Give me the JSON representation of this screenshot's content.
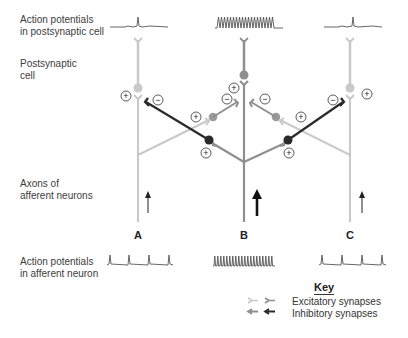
{
  "labels": {
    "ap_post_line1": "Action potentials",
    "ap_post_line2": "in postsynaptic cell",
    "postsyn_line1": "Postsynaptic",
    "postsyn_line2": "cell",
    "axons_line1": "Axons of",
    "axons_line2": "afferent neurons",
    "ap_aff_line1": "Action potentials",
    "ap_aff_line2": "in afferent neuron"
  },
  "neurons": [
    {
      "id": "A",
      "label": "A",
      "afferent_activity": "low",
      "postsynaptic_activity": "single spike"
    },
    {
      "id": "B",
      "label": "B",
      "afferent_activity": "high",
      "postsynaptic_activity": "high-frequency firing"
    },
    {
      "id": "C",
      "label": "C",
      "afferent_activity": "low",
      "postsynaptic_activity": "single spike"
    }
  ],
  "synapse_signs": {
    "excitatory": "+",
    "inhibitory": "−"
  },
  "key": {
    "title": "Key",
    "excitatory": "Excitatory synapses",
    "inhibitory": "Inhibitory synapses"
  },
  "colors": {
    "light": "#c9c9c9",
    "medium": "#8f8f8f",
    "dark": "#2a2a2a",
    "trace": "#555555"
  }
}
